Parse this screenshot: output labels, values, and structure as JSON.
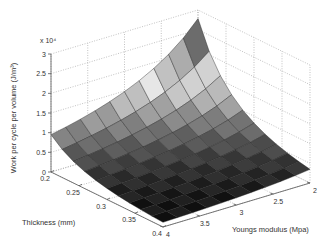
{
  "chart_data": {
    "type": "surface3d",
    "title": "",
    "xlabel": "Thickness (mm)",
    "ylabel": "Youngs modulus (Mpa)",
    "zlabel": "Work per cycle per volume (J/m³)",
    "z_multiplier_label": "x 10⁴",
    "x_range": [
      0.2,
      0.4
    ],
    "y_range": [
      2,
      4
    ],
    "z_range": [
      0,
      30000
    ],
    "x_ticks": [
      "0.2",
      "0.25",
      "0.3",
      "0.35",
      "0.4"
    ],
    "y_ticks": [
      "2",
      "2.5",
      "3",
      "3.5",
      "4"
    ],
    "z_ticks": [
      "0",
      "0.5",
      "1",
      "1.5",
      "2",
      "2.5",
      "3"
    ],
    "grid": true,
    "colormap": "gray",
    "surface_samples": {
      "description": "Work per cycle per volume (J/m^3) estimated from surface corners",
      "points": [
        {
          "thickness": 0.2,
          "youngs_modulus": 4,
          "value": 9500
        },
        {
          "thickness": 0.2,
          "youngs_modulus": 3,
          "value": 15000
        },
        {
          "thickness": 0.2,
          "youngs_modulus": 2,
          "value": 28000
        },
        {
          "thickness": 0.25,
          "youngs_modulus": 2,
          "value": 11500
        },
        {
          "thickness": 0.3,
          "youngs_modulus": 2,
          "value": 5500
        },
        {
          "thickness": 0.4,
          "youngs_modulus": 2,
          "value": 1700
        },
        {
          "thickness": 0.4,
          "youngs_modulus": 4,
          "value": 600
        }
      ]
    },
    "grid_cells": {
      "thickness": 10,
      "youngs_modulus": 10
    }
  }
}
